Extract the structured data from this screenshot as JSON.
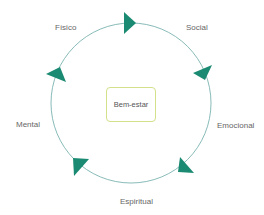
{
  "diagram": {
    "type": "cycle",
    "center": {
      "label": "Bem-estar",
      "border_color": "#d4e08a"
    },
    "ring_color": "#5fa3a0",
    "arrow_color": "#1b8a72",
    "nodes": [
      {
        "label": "Físico"
      },
      {
        "label": "Social"
      },
      {
        "label": "Emocional"
      },
      {
        "label": "Espiritual"
      },
      {
        "label": "Mental"
      }
    ]
  }
}
